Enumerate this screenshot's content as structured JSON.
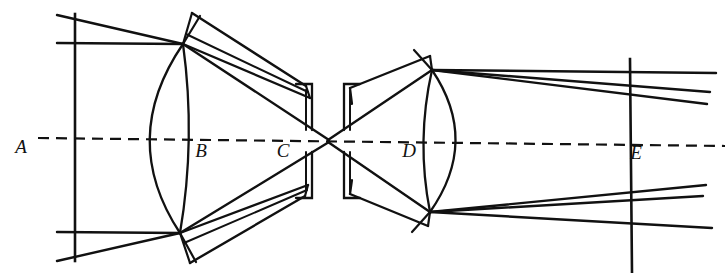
{
  "figure": {
    "domain": "diagram",
    "background_color": "#ffffff",
    "ink_color": "#111111",
    "width": 725,
    "height": 273
  },
  "labels": [
    {
      "id": "A",
      "text": "A",
      "x": 21,
      "y": 153,
      "meaning": "object-plane-marker"
    },
    {
      "id": "B",
      "text": "B",
      "x": 201,
      "y": 157,
      "meaning": "left-lens-marker"
    },
    {
      "id": "C",
      "text": "C",
      "x": 283,
      "y": 157,
      "meaning": "central-slit-marker"
    },
    {
      "id": "D",
      "text": "D",
      "x": 409,
      "y": 157,
      "meaning": "right-lens-marker"
    },
    {
      "id": "E",
      "text": "E",
      "x": 636,
      "y": 159,
      "meaning": "image-plane-marker"
    }
  ],
  "axis": {
    "name": "optical-axis",
    "style": "dashed",
    "dash_pattern": "11 7",
    "stroke_width": 2.2,
    "x1": 38,
    "y1": 138,
    "x2": 725,
    "y2": 146
  },
  "planes": [
    {
      "name": "entrance-plane-A",
      "x": 75,
      "y_top": 14,
      "y_bottom": 261,
      "stroke_width": 2.4
    },
    {
      "name": "exit-plane-E",
      "x": 630,
      "y_top": 59,
      "y_bottom": 273,
      "stroke_width": 2.4
    }
  ],
  "nodes": [
    {
      "name": "upper-left-node",
      "x": 183,
      "y": 44
    },
    {
      "name": "lower-left-node",
      "x": 180,
      "y": 233
    },
    {
      "name": "center-crossing-node",
      "x": 328,
      "y": 141
    },
    {
      "name": "upper-right-node",
      "x": 432,
      "y": 70
    },
    {
      "name": "lower-right-node",
      "x": 430,
      "y": 212
    }
  ],
  "lenses": [
    {
      "name": "left-lens-B",
      "type": "biconvex",
      "top_x": 183,
      "top_y": 44,
      "bottom_x": 180,
      "bottom_y": 233,
      "left_vertex_x": 120,
      "right_vertex_x": 194,
      "stroke_width": 2.2
    },
    {
      "name": "right-lens-D",
      "type": "biconvex",
      "top_x": 432,
      "top_y": 70,
      "bottom_x": 430,
      "bottom_y": 212,
      "left_vertex_x": 416,
      "right_vertex_x": 477,
      "stroke_width": 2.2
    }
  ],
  "slit": {
    "name": "central-slit-aperture",
    "gap_center_x": 328,
    "gap_center_y": 141,
    "left_blade_x": 305,
    "right_blade_x": 338,
    "upper_blade_y": 92,
    "lower_blade_y": 190,
    "stroke_width": 2.2
  },
  "incoming_rays": [
    {
      "name": "ray-in-upper-1",
      "x1": 57,
      "y1": 15,
      "x2": 183,
      "y2": 44
    },
    {
      "name": "ray-in-upper-2",
      "x1": 57,
      "y1": 43,
      "x2": 183,
      "y2": 44
    },
    {
      "name": "ray-in-lower-1",
      "x1": 57,
      "y1": 232,
      "x2": 180,
      "y2": 233
    },
    {
      "name": "ray-in-lower-2",
      "x1": 57,
      "y1": 261,
      "x2": 180,
      "y2": 233
    }
  ],
  "outgoing_rays": [
    {
      "name": "ray-out-upper-1",
      "x1": 432,
      "y1": 70,
      "x2": 716,
      "y2": 73
    },
    {
      "name": "ray-out-upper-2",
      "x1": 432,
      "y1": 70,
      "x2": 710,
      "y2": 92
    },
    {
      "name": "ray-out-upper-3",
      "x1": 432,
      "y1": 70,
      "x2": 707,
      "y2": 104
    },
    {
      "name": "ray-out-lower-1",
      "x1": 430,
      "y1": 212,
      "x2": 706,
      "y2": 185
    },
    {
      "name": "ray-out-lower-2",
      "x1": 430,
      "y1": 212,
      "x2": 703,
      "y2": 196
    },
    {
      "name": "ray-out-lower-3",
      "x1": 430,
      "y1": 212,
      "x2": 712,
      "y2": 228
    }
  ]
}
